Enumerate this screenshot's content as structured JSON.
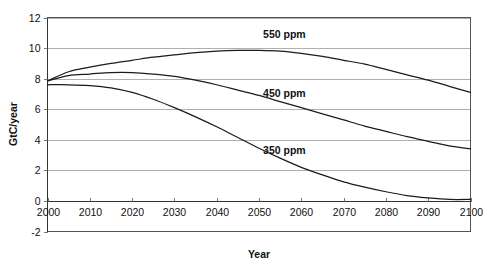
{
  "chart_data": {
    "type": "line",
    "title": "",
    "xlabel": "Year",
    "ylabel": "GtC/year",
    "xlim": [
      2000,
      2100
    ],
    "ylim": [
      -2,
      12
    ],
    "xticks": [
      2000,
      2010,
      2020,
      2030,
      2040,
      2050,
      2060,
      2070,
      2080,
      2090,
      2100
    ],
    "yticks": [
      -2,
      0,
      2,
      4,
      6,
      8,
      10,
      12
    ],
    "grid": "horizontal",
    "legend_position": "inline-annotations",
    "x": [
      2000,
      2005,
      2010,
      2015,
      2020,
      2025,
      2030,
      2035,
      2040,
      2045,
      2050,
      2055,
      2060,
      2065,
      2070,
      2075,
      2080,
      2085,
      2090,
      2095,
      2100
    ],
    "series": [
      {
        "name": "550 ppm",
        "label": "550 ppm",
        "color": "#1b1b1b",
        "values": [
          7.85,
          8.45,
          8.75,
          9.0,
          9.2,
          9.4,
          9.55,
          9.7,
          9.8,
          9.85,
          9.85,
          9.8,
          9.65,
          9.45,
          9.2,
          8.95,
          8.6,
          8.25,
          7.9,
          7.5,
          7.1
        ]
      },
      {
        "name": "450 ppm",
        "label": "450 ppm",
        "color": "#1b1b1b",
        "values": [
          7.85,
          8.2,
          8.3,
          8.4,
          8.4,
          8.3,
          8.15,
          7.9,
          7.6,
          7.25,
          6.9,
          6.5,
          6.1,
          5.7,
          5.3,
          4.9,
          4.55,
          4.2,
          3.9,
          3.6,
          3.4
        ]
      },
      {
        "name": "350 ppm",
        "label": "350 ppm",
        "color": "#1b1b1b",
        "values": [
          7.6,
          7.6,
          7.55,
          7.4,
          7.1,
          6.65,
          6.1,
          5.5,
          4.85,
          4.15,
          3.45,
          2.8,
          2.2,
          1.7,
          1.25,
          0.9,
          0.6,
          0.35,
          0.2,
          0.1,
          0.1
        ]
      }
    ],
    "annotations": [
      {
        "text": "550 ppm",
        "x": 2056,
        "y": 10.65
      },
      {
        "text": "450 ppm",
        "x": 2056,
        "y": 6.8
      },
      {
        "text": "350 ppm",
        "x": 2056,
        "y": 3.1
      }
    ]
  }
}
